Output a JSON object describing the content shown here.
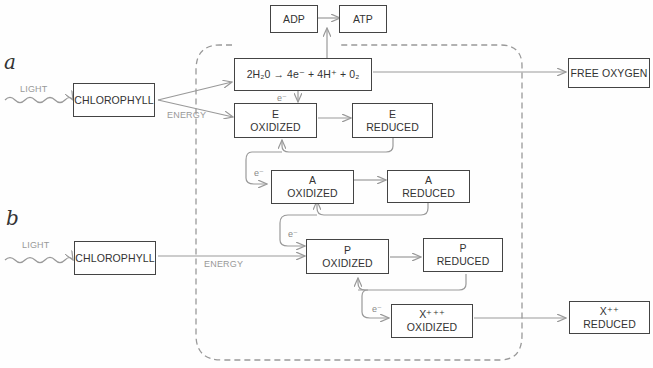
{
  "diagram": {
    "panels": {
      "a": "a",
      "b": "b"
    },
    "colors": {
      "wire": "#999999",
      "box_border": "#444444",
      "membrane": "#999999",
      "label": "#999999"
    },
    "row_a": {
      "light_label": "LIGHT",
      "chlorophyll": "CHLOROPHYLL",
      "energy_label": "ENERGY",
      "water_split": "2H₂0 → 4e⁻ + 4H⁺ + 0₂",
      "adp": "ADP",
      "atp": "ATP",
      "free_oxygen": "FREE OXYGEN"
    },
    "row_b": {
      "light_label": "LIGHT",
      "chlorophyll": "CHLOROPHYLL",
      "energy_label": "ENERGY"
    },
    "electron_label": "e⁻",
    "carriers": {
      "e_oxidized": {
        "name": "E",
        "state": "OXIDIZED"
      },
      "e_reduced": {
        "name": "E",
        "state": "REDUCED"
      },
      "a_oxidized": {
        "name": "A",
        "state": "OXIDIZED"
      },
      "a_reduced": {
        "name": "A",
        "state": "REDUCED"
      },
      "p_oxidized": {
        "name": "P",
        "state": "OXIDIZED"
      },
      "p_reduced": {
        "name": "P",
        "state": "REDUCED"
      },
      "x_oxidized": {
        "name": "X⁺⁺⁺",
        "state": "OXIDIZED"
      },
      "x_reduced": {
        "name": "X⁺⁺",
        "state": "REDUCED"
      }
    }
  }
}
